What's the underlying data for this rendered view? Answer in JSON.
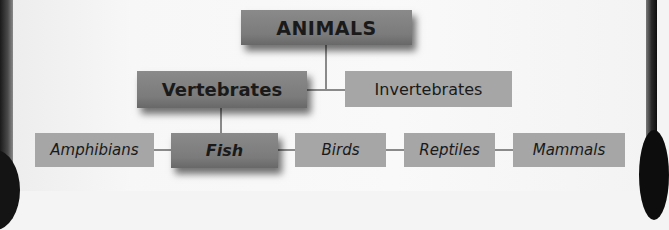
{
  "diagram": {
    "type": "hierarchy",
    "root": {
      "id": "animals",
      "label": "ANIMALS",
      "emphasis": true
    },
    "level2": [
      {
        "id": "vertebrates",
        "label": "Vertebrates",
        "emphasis": true
      },
      {
        "id": "invertebrates",
        "label": "Invertebrates",
        "emphasis": false
      }
    ],
    "level3": [
      {
        "id": "amphibians",
        "label": "Amphibians",
        "emphasis": false
      },
      {
        "id": "fish",
        "label": "Fish",
        "emphasis": true
      },
      {
        "id": "birds",
        "label": "Birds",
        "emphasis": false
      },
      {
        "id": "reptiles",
        "label": "Reptiles",
        "emphasis": false
      },
      {
        "id": "mammals",
        "label": "Mammals",
        "emphasis": false
      }
    ],
    "edges": [
      [
        "ANIMALS",
        "Vertebrates"
      ],
      [
        "ANIMALS",
        "Invertebrates"
      ],
      [
        "Vertebrates",
        "Amphibians"
      ],
      [
        "Vertebrates",
        "Fish"
      ],
      [
        "Vertebrates",
        "Birds"
      ],
      [
        "Vertebrates",
        "Reptiles"
      ],
      [
        "Vertebrates",
        "Mammals"
      ]
    ]
  },
  "colors": {
    "highlight_box": "#7b7b7b",
    "normal_box": "#a6a6a6",
    "connector": "#8a8a8a",
    "text": "#1a1a1a",
    "background": "#f7f7f7"
  }
}
